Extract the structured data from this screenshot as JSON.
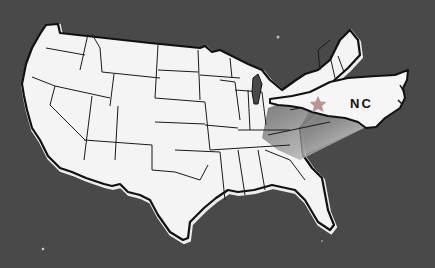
{
  "map": {
    "title": "United States map with North Carolina highlighted",
    "callout_label": "NC",
    "highlighted_state": "North Carolina",
    "marker": "star-icon",
    "colors": {
      "background": "#484848",
      "land": "#f4f4f4",
      "border": "#111111",
      "star": "#b48a8a",
      "gradient_dark": "#555555",
      "gradient_light": "#e8e8e8"
    }
  }
}
